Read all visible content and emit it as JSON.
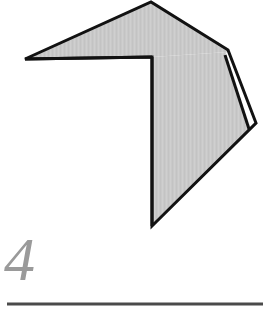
{
  "figure": {
    "caption_number": "4",
    "caption_color": "#9a9a9a",
    "background_color": "#ffffff",
    "rule": {
      "name": "horizontal-rule",
      "x1": 7,
      "y1": 304,
      "x2": 263,
      "y2": 304,
      "thickness": 3,
      "color": "#4a4a4a"
    },
    "shape": {
      "name": "folded-polygon",
      "fill_color": "#c9c9c9",
      "stroke_color": "#121212",
      "stroke_width": 3,
      "sliver_fill": "#ffffff",
      "upper_panel": {
        "label": "upper-triangular-panel",
        "points": [
          [
            25,
            59
          ],
          [
            151,
            2
          ],
          [
            228,
            52
          ],
          [
            152,
            57
          ]
        ]
      },
      "lower_panel": {
        "label": "lower-quadrilateral-panel",
        "points": [
          [
            152,
            57
          ],
          [
            228,
            52
          ],
          [
            252,
            126
          ],
          [
            152,
            226
          ]
        ]
      },
      "sliver_wedge": {
        "label": "folded-edge-sliver",
        "points": [
          [
            228,
            50
          ],
          [
            256,
            123
          ],
          [
            249,
            129
          ],
          [
            225,
            55
          ]
        ]
      },
      "outline": [
        [
          25,
          59
        ],
        [
          151,
          2
        ],
        [
          228,
          50
        ],
        [
          256,
          123
        ],
        [
          152,
          226
        ],
        [
          152,
          57
        ]
      ]
    }
  }
}
